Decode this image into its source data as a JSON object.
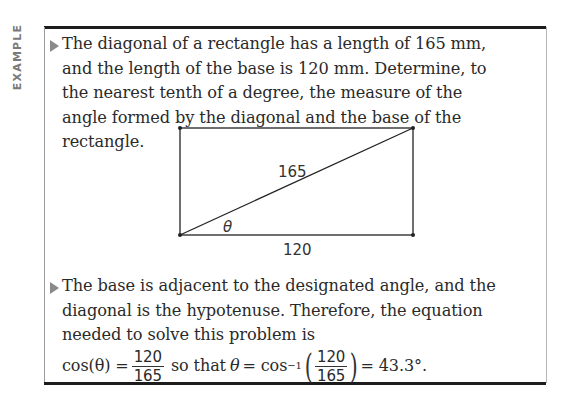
{
  "label": "EXAMPLE",
  "problem": {
    "text": "The diagonal of a rectangle has a length of 165 mm, and the length of the base is 120 mm. Determine, to the nearest tenth of a degree, the measure of the angle formed by the diagonal and the base of the rectangle."
  },
  "figure": {
    "diagonal_label": "165",
    "base_label": "120",
    "angle_label": "θ"
  },
  "solution": {
    "text": "The base is adjacent to the designated angle, and the diagonal is the hypotenuse. Therefore, the equation needed to solve this problem is",
    "eq_lhs": "cos(θ) =",
    "frac1_num": "120",
    "frac1_den": "165",
    "connector": "so that",
    "theta": "θ",
    "eq2": "= cos",
    "inv": "−1",
    "frac2_num": "120",
    "frac2_den": "165",
    "result": "= 43.3°."
  }
}
